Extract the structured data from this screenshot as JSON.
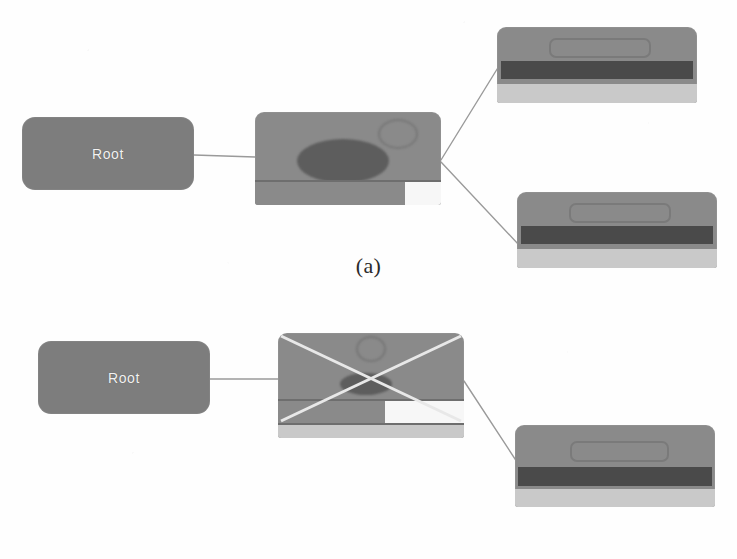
{
  "figure": {
    "width": 737,
    "height": 559,
    "background_color": "#fefefe",
    "caption_font": "serif"
  },
  "palette": {
    "node_gray": "#7d7d7d",
    "thumb_gray": "#8a8a8a",
    "blob_dark": "#5d5d5d",
    "band_dark": "#4a4a4a",
    "strip_light": "#c9c9c9",
    "strip_white": "#f7f7f7",
    "edge_line": "#9a9a9a",
    "cross_line": "#e8e8e8",
    "label_text": "#f2f2f2",
    "caption_text": "#2b2b2b"
  },
  "panels": [
    {
      "id": "a",
      "label": "(a)",
      "description": "Root node expanded to one page node which expands to two child page nodes",
      "nodes": [
        {
          "id": "a-root",
          "kind": "root-box",
          "label": "Root",
          "x": 22,
          "y": 117,
          "w": 172,
          "h": 73
        },
        {
          "id": "a-mid",
          "kind": "page-thumbnail",
          "label": "",
          "x": 255,
          "y": 112,
          "w": 186,
          "h": 93,
          "crossed_out": false,
          "features": [
            "hero-ellipse",
            "small-circle",
            "footer-bar",
            "white-swatch"
          ]
        },
        {
          "id": "a-child-top",
          "kind": "page-thumbnail",
          "label": "",
          "x": 497,
          "y": 27,
          "w": 200,
          "h": 76,
          "crossed_out": false,
          "features": [
            "pill-outline",
            "dark-band",
            "light-footer"
          ]
        },
        {
          "id": "a-child-bottom",
          "kind": "page-thumbnail",
          "label": "",
          "x": 517,
          "y": 192,
          "w": 200,
          "h": 76,
          "crossed_out": false,
          "features": [
            "pill-outline",
            "dark-band",
            "light-footer"
          ]
        }
      ],
      "edges": [
        {
          "from": "a-root",
          "to": "a-mid",
          "x1": 194,
          "y1": 155,
          "x2": 255,
          "y2": 157
        },
        {
          "from": "a-mid",
          "to": "a-child-top",
          "x1": 441,
          "y1": 160,
          "x2": 499,
          "y2": 66
        },
        {
          "from": "a-mid",
          "to": "a-child-bottom",
          "x1": 441,
          "y1": 162,
          "x2": 519,
          "y2": 245
        }
      ]
    },
    {
      "id": "b",
      "label": "(b)",
      "description": "Root node expanded to one page node marked with an X, which expands to a single child page node",
      "nodes": [
        {
          "id": "b-root",
          "kind": "root-box",
          "label": "Root",
          "x": 38,
          "y": 341,
          "w": 172,
          "h": 73
        },
        {
          "id": "b-mid",
          "kind": "page-thumbnail",
          "label": "",
          "x": 278,
          "y": 333,
          "w": 186,
          "h": 105,
          "crossed_out": true,
          "features": [
            "hero-ellipse",
            "small-circle",
            "footer-bar",
            "white-swatch",
            "second-footer",
            "x-overlay"
          ]
        },
        {
          "id": "b-child",
          "kind": "page-thumbnail",
          "label": "",
          "x": 515,
          "y": 425,
          "w": 200,
          "h": 82,
          "crossed_out": false,
          "features": [
            "pill-outline",
            "dark-band",
            "light-footer"
          ]
        }
      ],
      "edges": [
        {
          "from": "b-root",
          "to": "b-mid",
          "x1": 210,
          "y1": 379,
          "x2": 278,
          "y2": 379
        },
        {
          "from": "b-mid",
          "to": "b-child",
          "x1": 464,
          "y1": 381,
          "x2": 517,
          "y2": 462
        }
      ]
    }
  ]
}
